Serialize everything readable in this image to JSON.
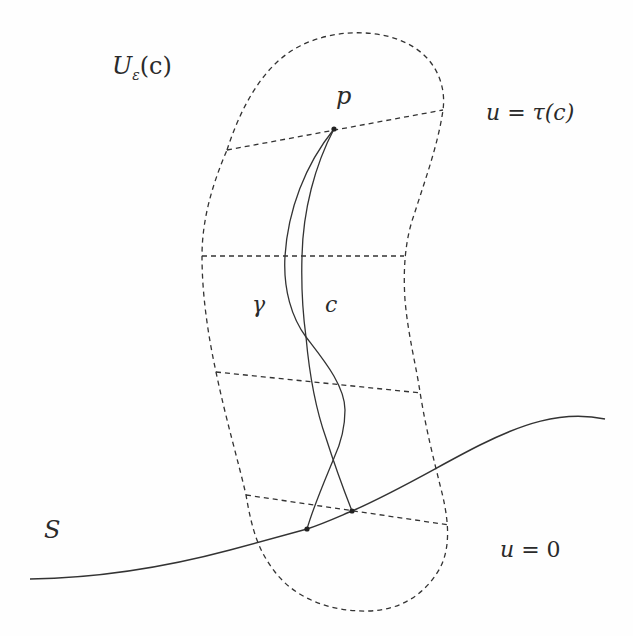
{
  "figure": {
    "labels": {
      "neighborhood": {
        "main": "U",
        "sub": "ε",
        "arg": "(c)"
      },
      "point_p": "p",
      "curve_gamma": "γ",
      "curve_c": "c",
      "surface": "S",
      "top_level": {
        "lhs": "u",
        "eq": " = ",
        "rhs": "τ(c)"
      },
      "bottom_level": {
        "lhs": "u",
        "eq": " = ",
        "rhs": "0"
      }
    },
    "colors": {
      "stroke": "#333333",
      "text": "#2a2a2a",
      "background": "#fefefe"
    },
    "points": {
      "p": [
        334,
        129
      ],
      "gamma_end": [
        307,
        529
      ],
      "c_end": [
        352,
        511
      ]
    }
  }
}
